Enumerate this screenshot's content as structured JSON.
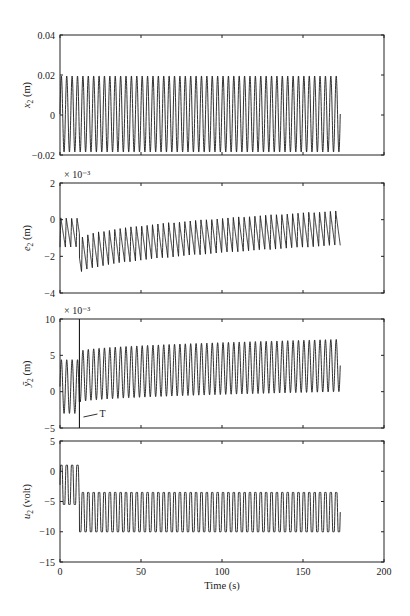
{
  "chart_data": [
    {
      "type": "line",
      "panel": 1,
      "ylabel": "x2 (m)",
      "ylabel_main": "x",
      "ylabel_sub": "2",
      "ylabel_unit": " (m)",
      "ylim": [
        -0.02,
        0.04
      ],
      "yticks": [
        -0.02,
        0,
        0.02,
        0.04
      ],
      "ytick_labels": [
        "−0.02",
        "0",
        "0.02",
        "0.04"
      ],
      "xlim": [
        0,
        200
      ],
      "exponent_label": "",
      "series": [
        {
          "name": "x2",
          "description": "steady sinusoidal oscillation",
          "t_start": 0,
          "t_end": 173,
          "mean": 0.0005,
          "amplitude": 0.019,
          "cycles": 52
        }
      ]
    },
    {
      "type": "line",
      "panel": 2,
      "ylabel": "e2 (m)",
      "ylabel_main": "e",
      "ylabel_sub": "2",
      "ylabel_unit": " (m)",
      "ylim": [
        -4,
        2
      ],
      "yticks": [
        -4,
        -2,
        0,
        2
      ],
      "ytick_labels": [
        "−4",
        "−2",
        "0",
        "2"
      ],
      "exponent_label": "× 10⁻³",
      "xlim": [
        0,
        200
      ],
      "series": [
        {
          "name": "e2",
          "description": "oscillation between 0 and -1.5 until ~12 s, drops to -3..-1, then slowly rises toward -1.5..0.5",
          "t_start": 0,
          "t_end": 173,
          "switch_time": 12,
          "segments": [
            {
              "t": [
                0,
                12
              ],
              "upper": 0.1,
              "lower": -1.5
            },
            {
              "t": [
                12,
                173
              ],
              "upper_start": -1.1,
              "upper_end": 0.5,
              "lower_start": -3.0,
              "lower_end": -1.4
            }
          ]
        }
      ]
    },
    {
      "type": "line",
      "panel": 3,
      "ylabel": "y~2 (m)",
      "ylabel_main": "ỹ",
      "ylabel_sub": "2",
      "ylabel_unit": " (m)",
      "ylim": [
        -5,
        10
      ],
      "yticks": [
        -5,
        0,
        5,
        10
      ],
      "ytick_labels": [
        "−5",
        "0",
        "5",
        "10"
      ],
      "exponent_label": "× 10⁻³",
      "xlim": [
        0,
        200
      ],
      "annotation": {
        "text": "T",
        "x": 12
      },
      "series": [
        {
          "name": "y~2",
          "description": "oscillation 4.5..-3 until T (~12 s), then grows to ~7..0",
          "t_start": 0,
          "t_end": 173,
          "switch_time": 12,
          "segments": [
            {
              "t": [
                0,
                12
              ],
              "upper": 4.4,
              "lower": -3.0
            },
            {
              "t": [
                12,
                173
              ],
              "upper_start": 5.5,
              "upper_end": 7.2,
              "lower_start": -1.5,
              "lower_end": 0.0
            }
          ]
        }
      ]
    },
    {
      "type": "line",
      "panel": 4,
      "ylabel": "u2 (volt)",
      "ylabel_main": "u",
      "ylabel_sub": "2",
      "ylabel_unit": " (volt)",
      "ylim": [
        -15,
        5
      ],
      "yticks": [
        -15,
        -10,
        -5,
        0,
        5
      ],
      "ytick_labels": [
        "−15",
        "−10",
        "−5",
        "0",
        "5"
      ],
      "exponent_label": "",
      "xlim": [
        0,
        200
      ],
      "xticks": [
        0,
        50,
        100,
        150,
        200
      ],
      "xtick_labels": [
        "0",
        "50",
        "100",
        "150",
        "200"
      ],
      "xlabel": "Time (s)",
      "series": [
        {
          "name": "u2",
          "description": "oscillation 1..-5.5 until ~12 s, then -3.5..-10",
          "t_start": 0,
          "t_end": 173,
          "switch_time": 12,
          "segments": [
            {
              "t": [
                0,
                12
              ],
              "upper": 1.0,
              "lower": -5.5
            },
            {
              "t": [
                12,
                173
              ],
              "upper": -3.5,
              "lower": -10.0
            }
          ]
        }
      ]
    }
  ],
  "xlabel": "Time (s)",
  "xtick_labels": [
    "0",
    "50",
    "100",
    "150",
    "200"
  ],
  "annotation_T": "T",
  "colors": {
    "line": "#1a1a1a",
    "frame": "#222222",
    "background": "#ffffff"
  }
}
